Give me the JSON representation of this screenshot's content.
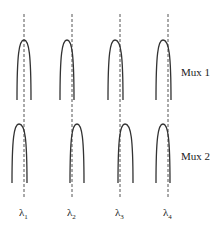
{
  "diagram": {
    "rows": [
      {
        "label": "Mux 1",
        "label_x": 181,
        "label_y": 76
      },
      {
        "label": "Mux 2",
        "label_x": 181,
        "label_y": 160
      }
    ],
    "wavelengths": [
      {
        "symbol": "λ",
        "subscript": "1",
        "x": 24
      },
      {
        "symbol": "λ",
        "subscript": "2",
        "x": 72
      },
      {
        "symbol": "λ",
        "subscript": "3",
        "x": 120
      },
      {
        "symbol": "λ",
        "subscript": "4",
        "x": 168
      }
    ],
    "mux1_peaks": [
      {
        "center_x": 24,
        "left": 17,
        "right": 31
      },
      {
        "center_x": 67,
        "left": 60,
        "right": 74
      },
      {
        "center_x": 115,
        "left": 108,
        "right": 123
      },
      {
        "center_x": 163,
        "left": 156,
        "right": 171
      }
    ],
    "mux2_peaks": [
      {
        "center_x": 19,
        "left": 12,
        "right": 27
      },
      {
        "center_x": 77,
        "left": 70,
        "right": 84
      },
      {
        "center_x": 125,
        "left": 118,
        "right": 133
      },
      {
        "center_x": 163,
        "left": 156,
        "right": 170
      }
    ],
    "colors": {
      "curve": "#333333",
      "dashed": "#555555",
      "text": "#222222"
    }
  }
}
